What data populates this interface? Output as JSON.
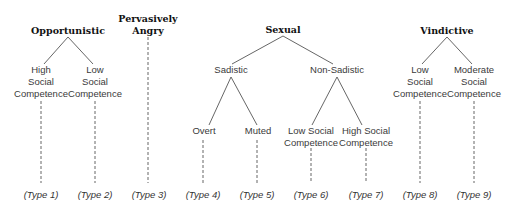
{
  "diagram": {
    "type": "taxonomy-tree",
    "line_color": "#555555",
    "roots": [
      {
        "id": "opportunistic",
        "label_lines": [
          "Opportunistic"
        ],
        "children": [
          {
            "id": "opp-high",
            "label_lines": [
              "High",
              "Social",
              "Competence"
            ],
            "type": "(Type 1)"
          },
          {
            "id": "opp-low",
            "label_lines": [
              "Low",
              "Social",
              "Competence"
            ],
            "type": "(Type 2)"
          }
        ]
      },
      {
        "id": "pervasively-angry",
        "label_lines": [
          "Pervasively",
          "Angry"
        ],
        "type": "(Type 3)"
      },
      {
        "id": "sexual",
        "label_lines": [
          "Sexual"
        ],
        "children": [
          {
            "id": "sadistic",
            "label_lines": [
              "Sadistic"
            ],
            "children": [
              {
                "id": "overt",
                "label_lines": [
                  "Overt"
                ],
                "type": "(Type 4)"
              },
              {
                "id": "muted",
                "label_lines": [
                  "Muted"
                ],
                "type": "(Type 5)"
              }
            ]
          },
          {
            "id": "non-sadistic",
            "label_lines": [
              "Non-Sadistic"
            ],
            "children": [
              {
                "id": "ns-low",
                "label_lines": [
                  "Low Social",
                  "Competence"
                ],
                "type": "(Type 6)"
              },
              {
                "id": "ns-high",
                "label_lines": [
                  "High Social",
                  "Competence"
                ],
                "type": "(Type 7)"
              }
            ]
          }
        ]
      },
      {
        "id": "vindictive",
        "label_lines": [
          "Vindictive"
        ],
        "children": [
          {
            "id": "vin-low",
            "label_lines": [
              "Low",
              "Social",
              "Competence"
            ],
            "type": "(Type 8)"
          },
          {
            "id": "vin-mod",
            "label_lines": [
              "Moderate",
              "Social",
              "Competence"
            ],
            "type": "(Type 9)"
          }
        ]
      }
    ]
  },
  "labels": {
    "opportunistic": "Opportunistic",
    "opp_high": [
      "High",
      "Social",
      "Competence"
    ],
    "opp_low": [
      "Low",
      "Social",
      "Competence"
    ],
    "pervasively_angry": [
      "Pervasively",
      "Angry"
    ],
    "sexual": "Sexual",
    "sadistic": "Sadistic",
    "non_sadistic": "Non-Sadistic",
    "overt": "Overt",
    "muted": "Muted",
    "ns_low": [
      "Low Social",
      "Competence"
    ],
    "ns_high": [
      "High Social",
      "Competence"
    ],
    "vindictive": "Vindictive",
    "vin_low": [
      "Low",
      "Social",
      "Competence"
    ],
    "vin_mod": [
      "Moderate",
      "Social",
      "Competence"
    ]
  },
  "types": [
    "(Type 1)",
    "(Type 2)",
    "(Type 3)",
    "(Type 4)",
    "(Type 5)",
    "(Type 6)",
    "(Type 7)",
    "(Type 8)",
    "(Type 9)"
  ]
}
